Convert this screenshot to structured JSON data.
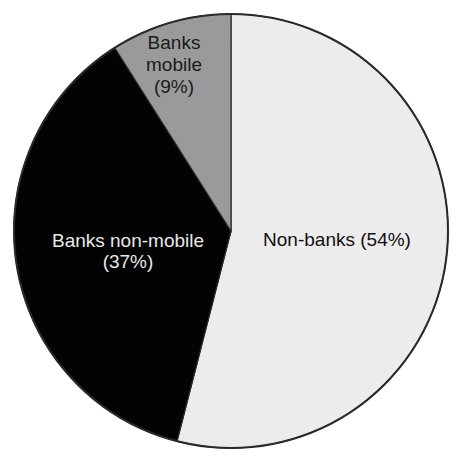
{
  "chart_data": {
    "type": "pie",
    "title": "",
    "categories": [
      "Non-banks",
      "Banks non-mobile",
      "Banks mobile"
    ],
    "values": [
      54,
      37,
      9
    ],
    "labels": [
      "Non-banks (54%)",
      "Banks non-mobile (37%)",
      "Banks mobile (9%)"
    ],
    "colors": [
      "#ececec",
      "#030303",
      "#9a9a9a"
    ],
    "start_angle_deg": 0,
    "direction": "clockwise",
    "legend": "none"
  },
  "slices": [
    {
      "name": "Non-banks",
      "line1": "Non-banks (54%)",
      "line2": ""
    },
    {
      "name": "Banks non-mobile",
      "line1": "Banks non-mobile",
      "line2": "(37%)"
    },
    {
      "name": "Banks mobile",
      "line1": "Banks",
      "line2": "mobile",
      "line3": "(9%)"
    }
  ]
}
